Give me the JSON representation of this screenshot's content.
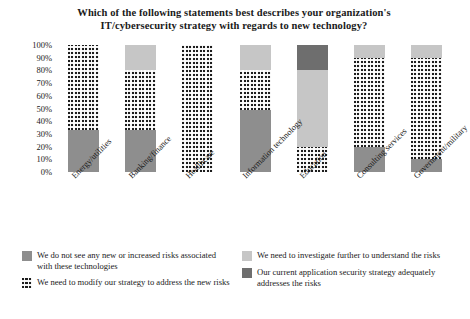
{
  "chart_data": {
    "type": "bar",
    "subtype": "stacked-100-percent",
    "title": "Which of the following statements best describes your organization's IT/cybersecurity strategy with regards to new technology?",
    "title_line1": "Which of the following statements best describes your organization's",
    "title_line2": "IT/cybersecurity strategy with regards to new technology?",
    "xlabel": "",
    "ylabel": "",
    "ylim": [
      0,
      100
    ],
    "ytick_labels": [
      "100%",
      "90%",
      "80%",
      "70%",
      "60%",
      "50%",
      "40%",
      "30%",
      "20%",
      "10%",
      "0%"
    ],
    "ytick_values": [
      100,
      90,
      80,
      70,
      60,
      50,
      40,
      30,
      20,
      10,
      0
    ],
    "grid": false,
    "legend_position": "bottom",
    "categories": [
      "Energy/utilities",
      "Banking/finance",
      "Healthcare",
      "Information technology",
      "Education",
      "Consulting services",
      "Government/military"
    ],
    "series": [
      {
        "name": "We do not see any new or increased risks associated with these technologies",
        "fill": "midgray",
        "color": "#8e8e8e",
        "values": [
          33,
          33,
          0,
          49,
          0,
          20,
          10
        ]
      },
      {
        "name": "We need to modify our strategy to address the new risks",
        "fill": "dotted",
        "color": "#1c1c1c",
        "values": [
          67,
          47,
          100,
          31,
          20,
          70,
          80
        ]
      },
      {
        "name": "We need to investigate further to understand the risks",
        "fill": "lightgray",
        "color": "#c6c6c6",
        "values": [
          0,
          20,
          0,
          20,
          60,
          10,
          10
        ]
      },
      {
        "name": "Our current application security strategy adequately addresses the risks",
        "fill": "darkgray",
        "color": "#6e6e6e",
        "values": [
          0,
          0,
          0,
          0,
          20,
          0,
          0
        ]
      }
    ],
    "bars": [
      {
        "category": "Energy/utilities",
        "segments": [
          {
            "fill": "dotted",
            "value": 67
          },
          {
            "fill": "midgray",
            "value": 33
          }
        ]
      },
      {
        "category": "Banking/finance",
        "segments": [
          {
            "fill": "lightgray",
            "value": 20
          },
          {
            "fill": "dotted",
            "value": 47
          },
          {
            "fill": "midgray",
            "value": 33
          }
        ]
      },
      {
        "category": "Healthcare",
        "segments": [
          {
            "fill": "dotted",
            "value": 100
          }
        ]
      },
      {
        "category": "Information technology",
        "segments": [
          {
            "fill": "lightgray",
            "value": 20
          },
          {
            "fill": "dotted",
            "value": 31
          },
          {
            "fill": "midgray",
            "value": 49
          }
        ]
      },
      {
        "category": "Education",
        "segments": [
          {
            "fill": "darkgray",
            "value": 20
          },
          {
            "fill": "lightgray",
            "value": 60
          },
          {
            "fill": "dotted",
            "value": 20
          }
        ]
      },
      {
        "category": "Consulting services",
        "segments": [
          {
            "fill": "lightgray",
            "value": 10
          },
          {
            "fill": "dotted",
            "value": 70
          },
          {
            "fill": "midgray",
            "value": 20
          }
        ]
      },
      {
        "category": "Government/military",
        "segments": [
          {
            "fill": "lightgray",
            "value": 10
          },
          {
            "fill": "dotted",
            "value": 80
          },
          {
            "fill": "midgray",
            "value": 10
          }
        ]
      }
    ],
    "legend": [
      {
        "fill": "midgray",
        "color": "#8e8e8e",
        "label": "We do not see any new or increased risks associated with these technologies"
      },
      {
        "fill": "dotted",
        "color": "#1c1c1c",
        "label": "We need to modify our strategy to address the new risks"
      },
      {
        "fill": "lightgray",
        "color": "#c6c6c6",
        "label": "We need to investigate further to understand the risks"
      },
      {
        "fill": "darkgray",
        "color": "#6e6e6e",
        "label": "Our current application security strategy adequately addresses the risks"
      }
    ]
  }
}
